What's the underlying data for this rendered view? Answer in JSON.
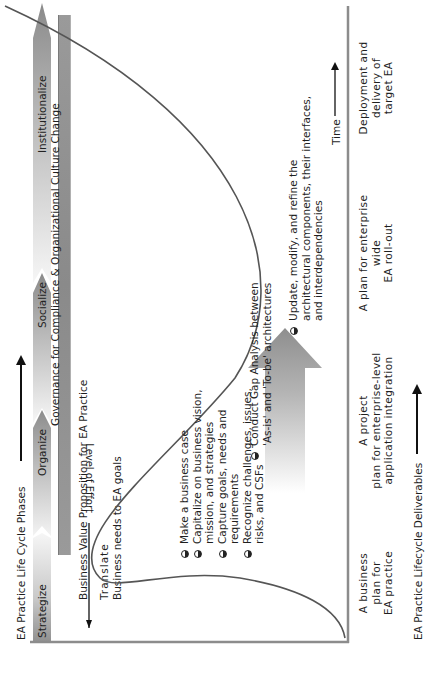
{
  "header": {
    "title": "EA Practice Life Cycle Phases"
  },
  "phases": [
    {
      "label": "Strategize"
    },
    {
      "label": "Organize"
    },
    {
      "label": "Socialize"
    },
    {
      "label": "Institutionalize"
    }
  ],
  "governance": {
    "label": "Governance for Compliance & Organizational Culture Change"
  },
  "value_proposition": {
    "label": "Business Value Proposition for EA Practice"
  },
  "translate": {
    "line1": "Translate",
    "line2": "Business needs to EA goals"
  },
  "axes": {
    "y_label": "Level of Effort",
    "x_label": "Time"
  },
  "activities_phase1": [
    {
      "lines": [
        "Make a business case"
      ]
    },
    {
      "lines": [
        "Capitalize on business vision,",
        "mission, and strategies"
      ]
    },
    {
      "lines": [
        "Capture goals, needs and",
        "requirements"
      ]
    },
    {
      "lines": [
        "Recognize challenges, issues,",
        "risks, and CSFs"
      ]
    }
  ],
  "activity_gap": {
    "lines": [
      "Conduct Gap Analysis between",
      "'As-is' and 'To-be' architectures"
    ]
  },
  "activity_update": {
    "lines": [
      "Update, modify, and refine the",
      "architectural components, their interfaces,",
      "and interdependencies"
    ]
  },
  "deliverables": {
    "label": "EA Practice Lifecycle Deliverables",
    "items": [
      {
        "lines": [
          "A business",
          "plan for",
          "EA practice"
        ]
      },
      {
        "lines": [
          "A project",
          "plan for enterprise-level",
          "application integration"
        ]
      },
      {
        "lines": [
          "A plan for enterprise",
          "wide",
          "EA roll-out"
        ]
      },
      {
        "lines": [
          "Deployment and",
          "delivery of",
          "target EA"
        ]
      }
    ]
  },
  "colors": {
    "curve": "#555555",
    "axis": "#8c8c8c",
    "band_dark": "#8a8a8a",
    "band_light": "#f4f4f4"
  }
}
